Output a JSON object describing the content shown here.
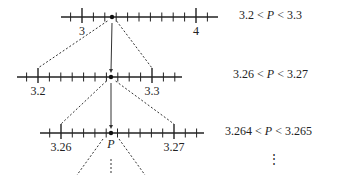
{
  "diagram": {
    "lines": [
      {
        "y": 17,
        "x_start": 61,
        "x_end": 218,
        "major_ticks": [
          {
            "x": 82,
            "label": "3"
          },
          {
            "x": 196,
            "label": "4"
          }
        ],
        "minor_step": 11.4,
        "point_x": 112,
        "inequality": {
          "left": "3.2",
          "var": "P",
          "right": "3.3",
          "text": "3.2 < P < 3.3"
        }
      },
      {
        "y": 77,
        "x_start": 17,
        "x_end": 182,
        "major_ticks": [
          {
            "x": 38,
            "label": "3.2"
          },
          {
            "x": 152,
            "label": "3.3"
          }
        ],
        "minor_step": 11.4,
        "point_x": 111,
        "inequality": {
          "left": "3.26",
          "var": "P",
          "right": "3.27",
          "text": "3.26 < P < 3.27"
        }
      },
      {
        "y": 133,
        "x_start": 40,
        "x_end": 204,
        "major_ticks": [
          {
            "x": 61,
            "label": "3.26"
          },
          {
            "x": 174,
            "label": "3.27"
          }
        ],
        "minor_step": 11.3,
        "point_x": 111,
        "point_label": "P",
        "inequality": {
          "left": "3.264",
          "var": "P",
          "right": "3.265",
          "text": "3.264 < P < 3.265"
        }
      }
    ],
    "continuation": "⋮",
    "relation": "<"
  }
}
